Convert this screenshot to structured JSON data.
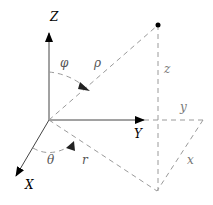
{
  "diagram": {
    "axes": {
      "z": "Z",
      "y": "Y",
      "x": "X"
    },
    "angles": {
      "phi": "φ",
      "theta": "θ"
    },
    "distances": {
      "rho": "ρ",
      "r": "r",
      "z": "z",
      "y": "y",
      "x": "x"
    },
    "colors": {
      "axis": "#000000",
      "dashed": "#9a9a9a",
      "point": "#000000"
    }
  }
}
